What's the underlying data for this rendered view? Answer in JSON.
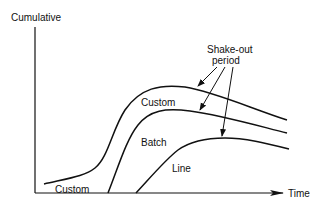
{
  "diagram": {
    "y_axis_label": "Cumulative",
    "x_axis_label": "Time",
    "curves": [
      {
        "name": "custom-curve",
        "label": "Custom",
        "label_pos": "upper"
      },
      {
        "name": "batch-curve",
        "label": "Batch"
      },
      {
        "name": "line-curve",
        "label": "Line"
      }
    ],
    "early_custom_label": "Custom",
    "annotation": {
      "line1": "Shake-out",
      "line2": "period",
      "points_to": [
        "custom-curve",
        "batch-curve",
        "line-curve"
      ]
    },
    "colors": {
      "ink": "#111111",
      "background": "#ffffff"
    }
  }
}
